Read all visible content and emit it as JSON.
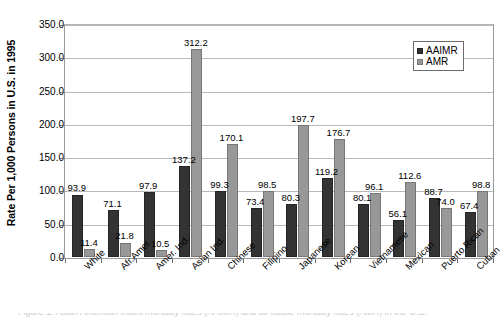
{
  "chart_data": {
    "type": "bar",
    "title": "",
    "xlabel": "",
    "ylabel": "Rate Per 1,000 Persons in U.S. in 1995",
    "ylim": [
      0,
      350
    ],
    "ytick_labels": [
      "0.0",
      "50.0",
      "100.0",
      "150.0",
      "200.0",
      "250.0",
      "300.0",
      "350.0"
    ],
    "ytick_values": [
      0,
      50,
      100,
      150,
      200,
      250,
      300,
      350
    ],
    "grid": true,
    "legend_position": "top-right",
    "categories": [
      "White",
      "Afr.Amer.",
      "Amer. Ind.",
      "Asian Ind.",
      "Chinese",
      "Filipino",
      "Japanese",
      "Korean",
      "Vietnamese",
      "Mexican",
      "Puerto Rican",
      "Cuban"
    ],
    "series": [
      {
        "name": "AAIMR",
        "color": "#333333",
        "values": [
          93.9,
          71.1,
          97.9,
          137.2,
          99.3,
          73.4,
          80.3,
          119.2,
          80.1,
          56.1,
          88.7,
          67.4
        ],
        "labels": [
          "93.9",
          "71.1",
          "97.9",
          "137.2",
          "99.3",
          "73.4",
          "80.3",
          "119.2",
          "80.1",
          "56.1",
          "88.7",
          "67.4"
        ]
      },
      {
        "name": "AMR",
        "color": "#989898",
        "values": [
          11.4,
          21.8,
          10.5,
          312.2,
          170.1,
          98.5,
          197.7,
          176.7,
          96.1,
          112.6,
          74.0,
          98.8
        ],
        "labels": [
          "11.4",
          "21.8",
          "10.5",
          "312.2",
          "170.1",
          "98.5",
          "197.7",
          "176.7",
          "96.1",
          "112.6",
          "74.0",
          "98.8"
        ]
      }
    ]
  },
  "legend": {
    "items": [
      {
        "label": "AAIMR"
      },
      {
        "label": "AMR"
      }
    ]
  },
  "caption": {
    "sliver_text": "Figure 1. Asian American infant mortality rates (AAIMR) and all-cause mortality rates (AMR) in the U.S."
  }
}
